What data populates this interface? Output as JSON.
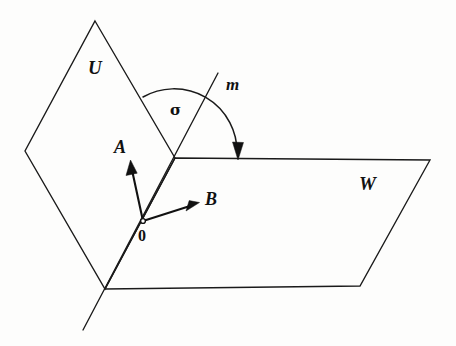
{
  "figure": {
    "background_color": "#fdfdfc",
    "ink_color": "#1a1a1a",
    "width": 456,
    "height": 346
  },
  "labels": {
    "plane_u": "U",
    "plane_w": "W",
    "line_m": "m",
    "angle_sigma": "σ",
    "vector_a": "A",
    "vector_b": "B",
    "origin": "0"
  },
  "geometry": {
    "plane_u": {
      "name": "U",
      "shape": "rhombus",
      "points": "95,21 175,158 105,289 25,151"
    },
    "plane_w": {
      "name": "W",
      "shape": "trapezoid",
      "points": "175,158 430,160 360,286 105,289"
    },
    "line_m": {
      "name": "m",
      "from": "218,73",
      "to": "83,330",
      "description": "axis of rotation passing through origin 0"
    },
    "vector_a": {
      "from": "143,221",
      "to": "131,162",
      "description": "vector in plane U perpendicular to m"
    },
    "vector_b": {
      "from": "143,221",
      "to": "198,203",
      "description": "vector in plane W perpendicular to m"
    },
    "origin": {
      "at": "143,221"
    },
    "angle_arc": {
      "center": "175,158",
      "radius": 63,
      "start": "143,97",
      "end": "238,158",
      "direction": "clockwise",
      "arrow_at_end": true
    }
  }
}
